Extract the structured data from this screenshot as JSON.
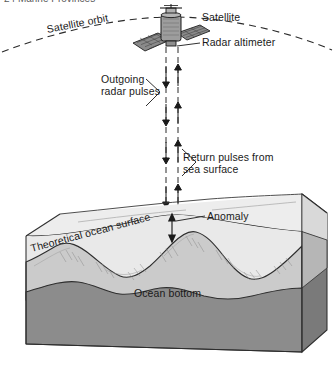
{
  "figure": {
    "header_text": "24   Marine Provinces",
    "labels": {
      "satellite": "Satellite",
      "radar_altimeter": "Radar altimeter",
      "satellite_orbit": "Satellite orbit",
      "outgoing_pulses": "Outgoing radar pulses",
      "return_pulses": "Return pulses from sea surface",
      "anomaly": "Anomaly",
      "theoretical_surface": "Theoretical ocean surface",
      "ocean_bottom": "Ocean bottom"
    },
    "colors": {
      "line": "#1a1a1a",
      "water_fill": "#e9e9e9",
      "water_side": "#dcdcdc",
      "rock_front": "#8c8c8c",
      "rock_side": "#6f6f6f",
      "seafloor_light": "#cfcfcf",
      "seamount_mid": "#b4b4b4",
      "satellite_body": "#9a9a9a",
      "panel": "#7d7d7d",
      "background": "#ffffff"
    },
    "elements": {
      "orbit_style": "dashed-arc",
      "outgoing_arrow_direction": "down",
      "return_arrow_direction": "up",
      "anomaly_marker": "double-headed-vertical-arrow",
      "theoretical_surface_style": "dashed-line",
      "sea_surface_style": "solid-bulging-line",
      "block_type": "3d-block-diagram"
    }
  }
}
